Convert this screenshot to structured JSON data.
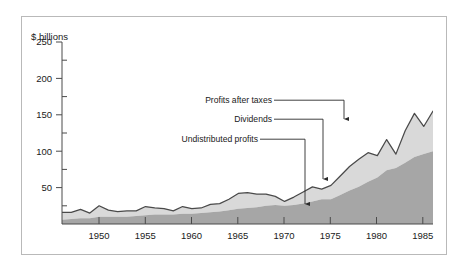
{
  "figure": {
    "name": "corporate-profits-stacked-area-figure",
    "frame_color": "#b9b9b9",
    "background": "#ffffff"
  },
  "chart_data": {
    "type": "area",
    "stacked": true,
    "title": "",
    "subtitle": "",
    "xlabel": "",
    "ylabel": "$ billions",
    "ylim": [
      0,
      250
    ],
    "xlim": [
      1946,
      1986
    ],
    "grid": false,
    "legend_position": "annotations-inline",
    "y_ticks_major": [
      50,
      100,
      150,
      200,
      250
    ],
    "y_ticks_minor": [
      25,
      75,
      125,
      175,
      225
    ],
    "x_ticks": [
      1950,
      1955,
      1960,
      1965,
      1970,
      1975,
      1980,
      1985
    ],
    "colors": {
      "dividends": "#a6a6a6",
      "undistributed_profits": "#d9d9d9",
      "total_line": "#4a4a4a",
      "axis": "#4a4a4a",
      "text": "#1a1a1a"
    },
    "x": [
      1946,
      1947,
      1948,
      1949,
      1950,
      1951,
      1952,
      1953,
      1954,
      1955,
      1956,
      1957,
      1958,
      1959,
      1960,
      1961,
      1962,
      1963,
      1964,
      1965,
      1966,
      1967,
      1968,
      1969,
      1970,
      1971,
      1972,
      1973,
      1974,
      1975,
      1976,
      1977,
      1978,
      1979,
      1980,
      1981,
      1982,
      1983,
      1984,
      1985,
      1986
    ],
    "series": [
      {
        "name": "Dividends",
        "color": "#a6a6a6",
        "values": [
          6,
          7,
          8,
          8,
          10,
          10,
          10,
          10,
          11,
          12,
          13,
          13,
          13,
          14,
          14,
          15,
          16,
          17,
          19,
          21,
          22,
          23,
          25,
          26,
          25,
          26,
          28,
          31,
          34,
          34,
          40,
          46,
          51,
          58,
          64,
          74,
          77,
          84,
          92,
          96,
          100
        ],
        "label_arrow_year": 1972.8
      },
      {
        "name": "Undistributed profits",
        "color": "#d9d9d9",
        "values": [
          10,
          9,
          12,
          7,
          15,
          9,
          7,
          8,
          7,
          12,
          9,
          8,
          5,
          10,
          7,
          7,
          11,
          11,
          15,
          21,
          21,
          18,
          16,
          12,
          6,
          11,
          16,
          20,
          14,
          19,
          26,
          33,
          38,
          40,
          30,
          42,
          19,
          44,
          60,
          38,
          55
        ],
        "label_arrow_year": 1975.2
      }
    ],
    "total_series": {
      "name": "Profits after taxes",
      "note": "Upper boundary = Dividends + Undistributed profits",
      "values": [
        16,
        16,
        20,
        15,
        25,
        19,
        17,
        18,
        18,
        24,
        22,
        21,
        18,
        24,
        21,
        22,
        27,
        28,
        34,
        42,
        43,
        41,
        41,
        38,
        31,
        37,
        44,
        51,
        48,
        53,
        66,
        79,
        89,
        98,
        94,
        116,
        96,
        128,
        152,
        134,
        155
      ],
      "label_arrow_year": 1977.0,
      "peak_value": 225,
      "peak_year": 1986
    },
    "annotations": [
      {
        "id": "profits-after-taxes",
        "text": "Profits after taxes",
        "target": "total upper boundary",
        "arrow_points_to_value": 112
      },
      {
        "id": "dividends",
        "text": "Dividends",
        "target": "dark gray band boundary",
        "arrow_points_to_value": 44
      },
      {
        "id": "undistributed-profits",
        "text": "Undistributed profits",
        "target": "light gray band",
        "arrow_points_to_value": 12
      }
    ]
  },
  "axes": {
    "y_axis_title": "$ billions",
    "y_tick_labels": [
      "250",
      "200",
      "150",
      "100",
      "50"
    ],
    "x_tick_labels": [
      "1950",
      "1955",
      "1960",
      "1965",
      "1970",
      "1975",
      "1980",
      "1985"
    ]
  },
  "annotations": {
    "profits_after_taxes": "Profits after taxes",
    "dividends": "Dividends",
    "undistributed_profits": "Undistributed profits"
  }
}
